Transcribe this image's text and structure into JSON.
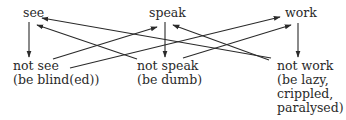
{
  "diagram": {
    "top_nodes": [
      {
        "id": "see",
        "label": "see"
      },
      {
        "id": "speak",
        "label": "speak"
      },
      {
        "id": "work",
        "label": "work"
      }
    ],
    "bottom_nodes": [
      {
        "id": "not_see",
        "lines": [
          "not see",
          "(be blind(ed))"
        ]
      },
      {
        "id": "not_speak",
        "lines": [
          "not speak",
          "(be dumb)"
        ]
      },
      {
        "id": "not_work",
        "lines": [
          "not work",
          "(be lazy,",
          "crippled,",
          "paralysed)"
        ]
      }
    ],
    "edges": [
      {
        "from": "see",
        "to": "not_see"
      },
      {
        "from": "speak",
        "to": "not_speak"
      },
      {
        "from": "work",
        "to": "not_work"
      },
      {
        "from": "not_see",
        "to": "speak"
      },
      {
        "from": "not_see",
        "to": "work"
      },
      {
        "from": "not_speak",
        "to": "see"
      },
      {
        "from": "not_speak",
        "to": "work"
      },
      {
        "from": "not_work",
        "to": "see"
      },
      {
        "from": "not_work",
        "to": "speak"
      }
    ],
    "line_color": "#2a2a2a",
    "text_color": "#2a2a2a"
  }
}
